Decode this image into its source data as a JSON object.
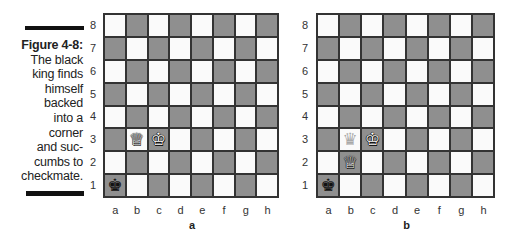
{
  "caption": {
    "figure_label": "Figure 4-8:",
    "lines": [
      "The black",
      "king finds",
      "himself",
      "backed",
      "into a",
      "corner",
      "and suc-",
      "cumbs to",
      "checkmate."
    ]
  },
  "colors": {
    "light_square": "#fafafa",
    "dark_square": "#8f8f8f",
    "border": "#333333",
    "bar": "#111111"
  },
  "ranks": [
    "8",
    "7",
    "6",
    "5",
    "4",
    "3",
    "2",
    "1"
  ],
  "files": [
    "a",
    "b",
    "c",
    "d",
    "e",
    "f",
    "g",
    "h"
  ],
  "boards": [
    {
      "label": "a",
      "pieces": [
        {
          "square": "a1",
          "piece": "king",
          "color": "black",
          "glyph": "♚"
        },
        {
          "square": "b3",
          "piece": "queen",
          "color": "white",
          "glyph": "♕"
        },
        {
          "square": "c3",
          "piece": "king",
          "color": "white",
          "glyph": "♔"
        }
      ]
    },
    {
      "label": "b",
      "pieces": [
        {
          "square": "a1",
          "piece": "king",
          "color": "black",
          "glyph": "♚"
        },
        {
          "square": "b3",
          "piece": "queen",
          "color": "ghost",
          "glyph": "♛",
          "note": "previous position"
        },
        {
          "square": "b2",
          "piece": "queen",
          "color": "white",
          "glyph": "♕"
        },
        {
          "square": "c3",
          "piece": "king",
          "color": "white",
          "glyph": "♔"
        }
      ],
      "move_arrow": {
        "from": "b3",
        "to": "b2"
      }
    }
  ]
}
